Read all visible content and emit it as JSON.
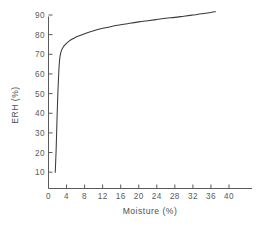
{
  "chart_data": {
    "type": "line",
    "title": "",
    "subtitle": "",
    "xlabel": "Moisture (%)",
    "ylabel": "ERH (%)",
    "xlim": [
      0,
      42
    ],
    "ylim": [
      0,
      94
    ],
    "grid": false,
    "legend": null,
    "legend_position": "none",
    "xticks": [
      0,
      4,
      8,
      12,
      16,
      20,
      24,
      28,
      32,
      36,
      40
    ],
    "xtick_labels": [
      "0",
      "4",
      "8",
      "12",
      "16",
      "20",
      "24",
      "28",
      "32",
      "36",
      "40"
    ],
    "yticks": [
      10,
      20,
      30,
      40,
      50,
      60,
      70,
      80,
      90
    ],
    "ytick_labels": [
      "10",
      "20",
      "30",
      "40",
      "50",
      "60",
      "70",
      "80",
      "90"
    ],
    "series": [
      {
        "name": "ERH vs Moisture",
        "color": "#3a3a3a",
        "x": [
          1.5,
          1.7,
          1.9,
          2.1,
          2.3,
          2.5,
          2.8,
          3.2,
          3.8,
          4.5,
          5.5,
          6.5,
          8.0,
          10.0,
          12.0,
          14.0,
          16.0,
          18.0,
          20.0,
          22.0,
          24.0,
          26.0,
          28.0,
          30.0,
          32.0,
          34.0,
          36.0,
          37.0
        ],
        "y": [
          10.0,
          22.0,
          38.0,
          52.0,
          62.0,
          68.0,
          71.5,
          73.5,
          75.2,
          76.6,
          78.0,
          79.2,
          80.5,
          82.0,
          83.2,
          84.2,
          85.0,
          85.8,
          86.5,
          87.1,
          87.7,
          88.3,
          88.8,
          89.4,
          90.0,
          90.6,
          91.3,
          91.7
        ]
      }
    ],
    "annotations": []
  },
  "axis": {
    "x_label": "Moisture (%)",
    "y_label": "ERH (%)"
  }
}
